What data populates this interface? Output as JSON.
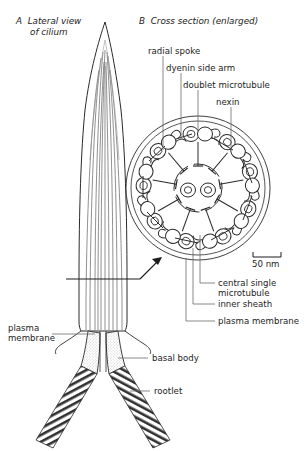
{
  "figure": {
    "panels": [
      {
        "id": "A",
        "letter": "A",
        "title_line1": "Lateral view",
        "title_line2": "of cilium"
      },
      {
        "id": "B",
        "letter": "B",
        "title_line1": "Cross section (enlarged)",
        "title_line2": ""
      }
    ]
  },
  "labels": {
    "radial_spoke": "radial spoke",
    "dyenin_side_arm": "dyenin side arm",
    "doublet_microtubule": "doublet microtubule",
    "nexin": "nexin",
    "central_single_microtubule_l1": "central single",
    "central_single_microtubule_l2": "microtubule",
    "inner_sheath": "inner sheath",
    "plasma_membrane_right": "plasma membrane",
    "plasma_membrane_left_l1": "plasma",
    "plasma_membrane_left_l2": "membrane",
    "basal_body": "basal body",
    "rootlet": "rootlet"
  },
  "scale_bar": {
    "value": "50 nm"
  },
  "colors": {
    "ink": "#1c1c1c",
    "stroke": "#2a2a2a",
    "leader": "#555555",
    "fill_light": "#f2f2f2",
    "stipple": "#7a7a7a",
    "background": "#ffffff"
  },
  "structure": {
    "axoneme_pattern": "9+2",
    "outer_doublets": 9,
    "central_singlets": 2
  }
}
